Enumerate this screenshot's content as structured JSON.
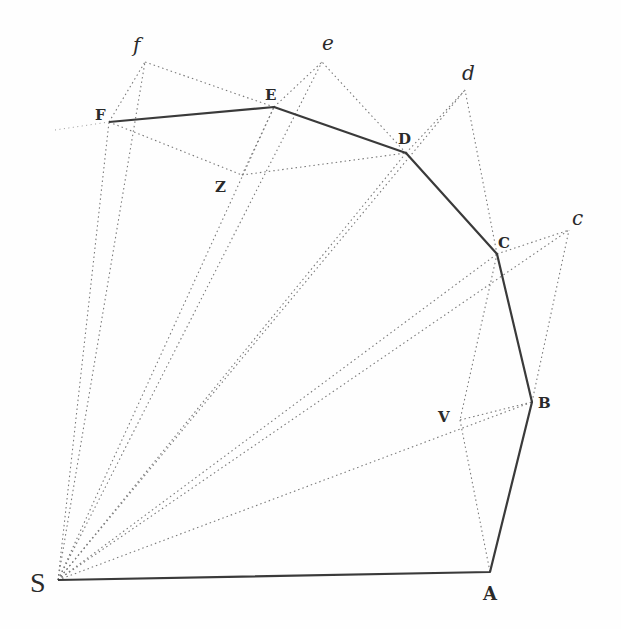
{
  "diagram": {
    "points": {
      "S": {
        "label": "S",
        "x": 58,
        "y": 580
      },
      "A": {
        "label": "A",
        "x": 490,
        "y": 572
      },
      "B": {
        "label": "B",
        "x": 532,
        "y": 402
      },
      "C": {
        "label": "C",
        "x": 497,
        "y": 254
      },
      "D": {
        "label": "D",
        "x": 406,
        "y": 153
      },
      "E": {
        "label": "E",
        "x": 274,
        "y": 107
      },
      "F": {
        "label": "F",
        "x": 109,
        "y": 122
      },
      "c": {
        "label": "c",
        "x": 569,
        "y": 230
      },
      "d": {
        "label": "d",
        "x": 465,
        "y": 90
      },
      "e": {
        "label": "e",
        "x": 322,
        "y": 62
      },
      "f": {
        "label": "f",
        "x": 145,
        "y": 62
      },
      "V": {
        "label": "V",
        "x": 460,
        "y": 420
      },
      "Z": {
        "label": "Z",
        "x": 242,
        "y": 175
      }
    },
    "solid_path": [
      "S",
      "A",
      "B",
      "C",
      "D",
      "E",
      "F"
    ],
    "line_color": "#3a3a3a",
    "dotted_color": "#7a7a7a"
  }
}
